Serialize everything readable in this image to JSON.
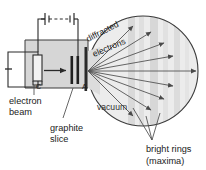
{
  "figure": {
    "labels": {
      "electron_beam": "electron",
      "electron_beam_2": "beam",
      "graphite_slice": "graphite",
      "graphite_slice_2": "slice",
      "diffracted": "diffracted",
      "electrons": "electrons",
      "vacuum": "vacuum",
      "bright_rings": "bright rings",
      "maxima": "(maxima)",
      "cathode": "C",
      "anode": "A",
      "negative_terminal": "–"
    },
    "colors": {
      "line": "#3a3a3a",
      "ray": "#555555",
      "tube_fill": "#d8d8d8",
      "sphere_fill": "#ebebeb",
      "ring_band": "#d2d2d2",
      "text": "#1a1a1a",
      "background": "#ffffff"
    },
    "geometry": {
      "sphere_center_x": 143,
      "sphere_center_y": 71,
      "sphere_radius": 55,
      "source_x": 82,
      "source_y": 71,
      "ray_count": 9
    },
    "components": [
      {
        "name": "battery",
        "cells": 2,
        "dashed_link": true
      },
      {
        "name": "cathode",
        "letter": "C"
      },
      {
        "name": "anode",
        "letter": "A"
      },
      {
        "name": "graphite-target",
        "bars": 2
      },
      {
        "name": "vacuum-chamber"
      },
      {
        "name": "diffraction-sphere"
      }
    ]
  }
}
